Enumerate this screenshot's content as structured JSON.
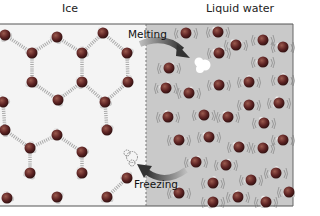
{
  "headings": {
    "ice": "Ice",
    "liquid": "Liquid water"
  },
  "processes": {
    "melting": "Melting",
    "freezing": "Freezing"
  },
  "colors": {
    "ice_bg": "#f4f4f4",
    "liquid_bg": "#c9c9c9",
    "oxygen": "#6a2a2a",
    "hydrogen": "#e8e8e8",
    "arrow": "#3e3e3e",
    "frame": "#555555"
  },
  "ice_molecules": [
    [
      5,
      35
    ],
    [
      57,
      37
    ],
    [
      103,
      33
    ],
    [
      32,
      53
    ],
    [
      82,
      53
    ],
    [
      127,
      53
    ],
    [
      32,
      82
    ],
    [
      82,
      82
    ],
    [
      128,
      82
    ],
    [
      3,
      102
    ],
    [
      58,
      100
    ],
    [
      105,
      102
    ],
    [
      5,
      130
    ],
    [
      57,
      135
    ],
    [
      107,
      130
    ],
    [
      30,
      148
    ],
    [
      82,
      152
    ],
    [
      30,
      173
    ],
    [
      82,
      173
    ],
    [
      127,
      178
    ],
    [
      7,
      198
    ],
    [
      57,
      197
    ],
    [
      107,
      197
    ]
  ],
  "liquid_molecules": [
    [
      186,
      33
    ],
    [
      218,
      32
    ],
    [
      236,
      45
    ],
    [
      263,
      40
    ],
    [
      283,
      47
    ],
    [
      219,
      53
    ],
    [
      169,
      68
    ],
    [
      263,
      62
    ],
    [
      166,
      88
    ],
    [
      189,
      93
    ],
    [
      219,
      85
    ],
    [
      249,
      82
    ],
    [
      283,
      80
    ],
    [
      249,
      105
    ],
    [
      279,
      103
    ],
    [
      168,
      117
    ],
    [
      204,
      115
    ],
    [
      228,
      117
    ],
    [
      264,
      123
    ],
    [
      179,
      140
    ],
    [
      209,
      137
    ],
    [
      239,
      147
    ],
    [
      263,
      148
    ],
    [
      283,
      140
    ],
    [
      196,
      162
    ],
    [
      226,
      165
    ],
    [
      251,
      180
    ],
    [
      276,
      173
    ],
    [
      213,
      183
    ],
    [
      289,
      192
    ],
    [
      179,
      193
    ],
    [
      238,
      197
    ],
    [
      213,
      202
    ],
    [
      266,
      202
    ]
  ]
}
